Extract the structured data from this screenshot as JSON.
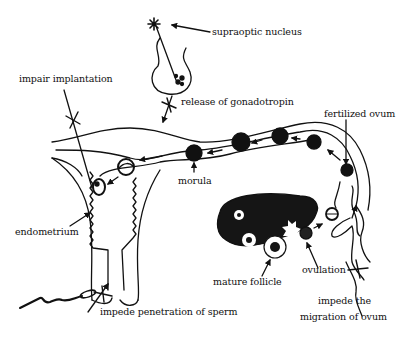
{
  "diagram": {
    "colors": {
      "ink": "#111111",
      "background": "#ffffff",
      "ovary_fill": "#151515"
    },
    "labels": {
      "supraoptic_nucleus": "supraoptic nucleus",
      "release_of_gonadotropin": "release of gonadotropin",
      "impair_implantation": "impair implantation",
      "fertilized_ovum": "fertilized ovum",
      "morula": "morula",
      "endometrium": "endometrium",
      "mature_follicle": "mature follicle",
      "ovulation": "ovulation",
      "impede_penetration_of_sperm": "impede penetration of sperm",
      "impede_migration_line1": "impede the",
      "impede_migration_line2": "migration of ovum"
    },
    "blocked_sites": [
      "release of gonadotropin",
      "impair implantation",
      "impede penetration of sperm",
      "impede the migration of ovum"
    ],
    "structures": [
      "hypothalamus-pituitary",
      "uterus",
      "cervix",
      "fallopian tube",
      "ovary",
      "fimbriae",
      "sperm"
    ]
  }
}
